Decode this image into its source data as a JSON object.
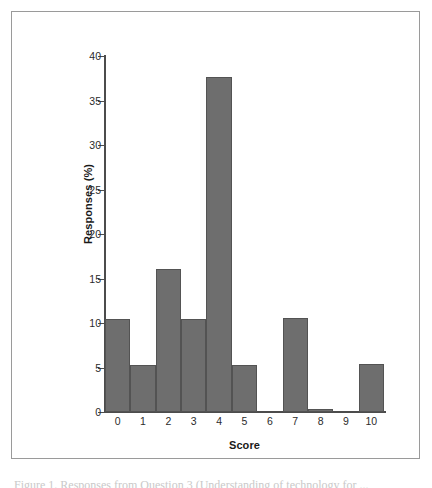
{
  "figure": {
    "background_color": "#ffffff",
    "border_color": "#9a9a9a",
    "caption_partial": "Figure 1. Responses from Question 3 (Understanding of technology for ..."
  },
  "chart_data": {
    "type": "bar",
    "title": "",
    "subtitle": "",
    "xlabel": "Score",
    "ylabel": "Responses (%)",
    "categories": [
      "0",
      "1",
      "2",
      "3",
      "4",
      "5",
      "6",
      "7",
      "8",
      "9",
      "10"
    ],
    "values": [
      10.5,
      5.3,
      16.1,
      10.5,
      37.6,
      5.3,
      0,
      10.6,
      0.3,
      0,
      5.4
    ],
    "xlim": [
      -0.5,
      10.5
    ],
    "ylim": [
      0,
      40
    ],
    "ytick_labels": [
      "0",
      "5",
      "10",
      "15",
      "20",
      "25",
      "30",
      "35",
      "40"
    ],
    "ytick_values": [
      0,
      5,
      10,
      15,
      20,
      25,
      30,
      35,
      40
    ],
    "xtick_labels": [
      "0",
      "1",
      "2",
      "3",
      "4",
      "5",
      "6",
      "7",
      "8",
      "9",
      "10"
    ],
    "grid": false,
    "legend": null,
    "legend_position": "none",
    "bar_fill_color": "#6e6e6e",
    "bar_edge_color": "#535353",
    "axis_color": "#4c4c4c",
    "annotations": []
  }
}
